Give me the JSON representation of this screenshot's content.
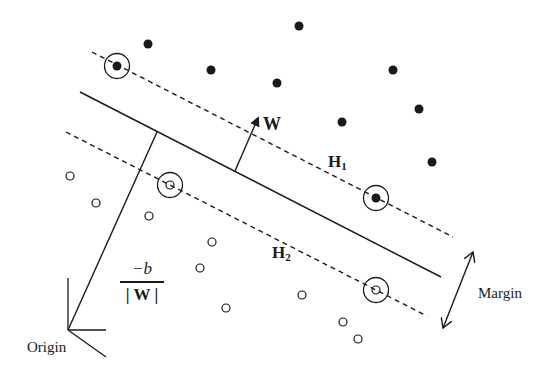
{
  "diagram": {
    "colors": {
      "ink": "#1a1a1a",
      "background": "#ffffff"
    },
    "labels": {
      "w_vector": "W",
      "h1_main": "H",
      "h1_sub": "1",
      "h2_main": "H",
      "h2_sub": "2",
      "margin": "Margin",
      "origin": "Origin",
      "offset_numerator": "−b",
      "offset_denominator": "| W |"
    },
    "hyperplane": {
      "x1": 80,
      "y1": 92,
      "x2": 441,
      "y2": 277
    },
    "h1": {
      "x1": 92,
      "y1": 52,
      "x2": 453,
      "y2": 237
    },
    "h2": {
      "x1": 66,
      "y1": 132,
      "x2": 427,
      "y2": 316
    },
    "w_arrow": {
      "x1": 235,
      "y1": 171,
      "x2": 258,
      "y2": 118
    },
    "origin_point": {
      "x": 68,
      "y": 330
    },
    "offset_line": {
      "x1": 68,
      "y1": 330,
      "x2": 157,
      "y2": 132
    },
    "margin_arrow": {
      "x1": 473,
      "y1": 252,
      "x2": 443,
      "y2": 328
    },
    "positive_points": [
      {
        "x": 148,
        "y": 44,
        "support": false
      },
      {
        "x": 117,
        "y": 66,
        "support": true
      },
      {
        "x": 299,
        "y": 26,
        "support": false
      },
      {
        "x": 211,
        "y": 70,
        "support": false
      },
      {
        "x": 277,
        "y": 83,
        "support": false
      },
      {
        "x": 393,
        "y": 70,
        "support": false
      },
      {
        "x": 342,
        "y": 122,
        "support": false
      },
      {
        "x": 419,
        "y": 109,
        "support": false
      },
      {
        "x": 432,
        "y": 162,
        "support": false
      },
      {
        "x": 376,
        "y": 198,
        "support": true
      }
    ],
    "negative_points": [
      {
        "x": 70,
        "y": 176,
        "support": false
      },
      {
        "x": 96,
        "y": 203,
        "support": false
      },
      {
        "x": 149,
        "y": 216,
        "support": false
      },
      {
        "x": 170,
        "y": 185,
        "support": true
      },
      {
        "x": 212,
        "y": 242,
        "support": false
      },
      {
        "x": 200,
        "y": 268,
        "support": false
      },
      {
        "x": 226,
        "y": 308,
        "support": false
      },
      {
        "x": 302,
        "y": 295,
        "support": false
      },
      {
        "x": 343,
        "y": 322,
        "support": false
      },
      {
        "x": 358,
        "y": 339,
        "support": false
      },
      {
        "x": 376,
        "y": 290,
        "support": true
      }
    ]
  }
}
